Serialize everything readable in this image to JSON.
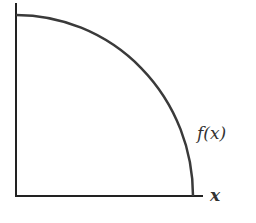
{
  "diagram": {
    "curve_label": "f(x)",
    "x_axis_label": "x",
    "colors": {
      "axis": "#222222",
      "curve": "#3a3a3a",
      "text": "#333333",
      "background": "#ffffff"
    }
  }
}
